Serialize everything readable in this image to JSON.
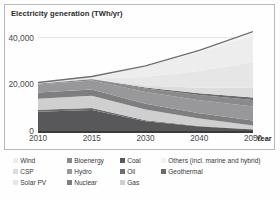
{
  "chart_data": {
    "type": "area",
    "stacked": true,
    "title": "Electricity generation (TWh/yr)",
    "xlabel": "Year",
    "ylabel": "",
    "x": [
      2010,
      2015,
      2030,
      2040,
      2050
    ],
    "xtick_labels": [
      "2010",
      "2015",
      "2030",
      "2040",
      "2050"
    ],
    "ytick_labels": [
      "0",
      "20,000",
      "40,000"
    ],
    "yticks": [
      0,
      20000,
      40000
    ],
    "ylim": [
      0,
      45000
    ],
    "grid": "horizontal",
    "legend_position": "bottom",
    "series": [
      {
        "name": "Coal",
        "color": "#58585a",
        "values": [
          8200,
          9000,
          4200,
          1900,
          600
        ]
      },
      {
        "name": "Oil",
        "color": "#6e6e70",
        "values": [
          950,
          850,
          420,
          230,
          110
        ]
      },
      {
        "name": "Gas",
        "color": "#cfcfd0",
        "values": [
          4700,
          5300,
          4600,
          3200,
          1700
        ]
      },
      {
        "name": "Nuclear",
        "color": "#7e7e80",
        "values": [
          2700,
          2600,
          2500,
          2300,
          2100
        ]
      },
      {
        "name": "Hydro",
        "color": "#98989a",
        "values": [
          3400,
          3900,
          5000,
          5600,
          6000
        ]
      },
      {
        "name": "Bioenergy",
        "color": "#8a8a8c",
        "values": [
          350,
          520,
          1500,
          2200,
          2800
        ]
      },
      {
        "name": "Geothermal",
        "color": "#6a6a6c",
        "values": [
          70,
          100,
          400,
          700,
          1000
        ]
      },
      {
        "name": "CSP",
        "color": "#dcdcdd",
        "values": [
          10,
          30,
          900,
          2400,
          4200
        ]
      },
      {
        "name": "Solar PV",
        "color": "#e6e6e7",
        "values": [
          35,
          230,
          3600,
          7200,
          11000
        ]
      },
      {
        "name": "Wind",
        "color": "#ededee",
        "values": [
          340,
          840,
          4500,
          8000,
          11500
        ]
      },
      {
        "name": "Others (incl. marine and hybrid)",
        "color": "#f2f2f3",
        "values": [
          5,
          15,
          300,
          800,
          1600
        ]
      }
    ]
  },
  "legend": {
    "items": [
      {
        "label": "Wind",
        "color": "#ededee",
        "col": 0,
        "row": 0
      },
      {
        "label": "CSP",
        "color": "#dcdcdd",
        "col": 0,
        "row": 1
      },
      {
        "label": "Solar PV",
        "color": "#e6e6e7",
        "col": 0,
        "row": 2
      },
      {
        "label": "Bioenergy",
        "color": "#8a8a8c",
        "col": 1,
        "row": 0
      },
      {
        "label": "Hydro",
        "color": "#98989a",
        "col": 1,
        "row": 1
      },
      {
        "label": "Nuclear",
        "color": "#7e7e80",
        "col": 1,
        "row": 2
      },
      {
        "label": "Coal",
        "color": "#58585a",
        "col": 2,
        "row": 0
      },
      {
        "label": "Oil",
        "color": "#6e6e70",
        "col": 2,
        "row": 1
      },
      {
        "label": "Gas",
        "color": "#cfcfd0",
        "col": 2,
        "row": 2
      },
      {
        "label": "Others (incl. marine and hybrid)",
        "color": "#f2f2f3",
        "col": 3,
        "row": 0
      },
      {
        "label": "Geothermal",
        "color": "#6a6a6c",
        "col": 3,
        "row": 1
      }
    ]
  },
  "style": {
    "grid_color": "#e2e2e2",
    "axis_color": "#3a3a3a",
    "border_color": "#b9b9b9",
    "text_color": "#3a3a3a"
  }
}
